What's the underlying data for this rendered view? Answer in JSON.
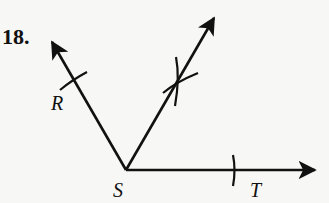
{
  "problem": {
    "number": "18."
  },
  "diagram": {
    "type": "angle-bisector-construction",
    "vertex": {
      "label": "S",
      "x": 126,
      "y": 170
    },
    "rays": [
      {
        "name": "ray-SR",
        "end": {
          "x": 50,
          "y": 40
        }
      },
      {
        "name": "ray-bisector",
        "end": {
          "x": 216,
          "y": 15
        }
      },
      {
        "name": "ray-ST",
        "end": {
          "x": 318,
          "y": 170
        }
      }
    ],
    "points": [
      {
        "label": "R",
        "x": 60,
        "y": 104
      },
      {
        "label": "S",
        "x": 117,
        "y": 195
      },
      {
        "label": "T",
        "x": 255,
        "y": 195
      }
    ],
    "colors": {
      "stroke": "#111111",
      "background": "#f7f7f5"
    }
  }
}
